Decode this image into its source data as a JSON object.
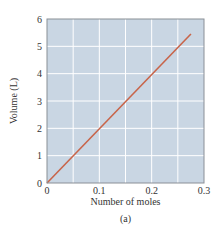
{
  "chart_data": {
    "type": "line",
    "title": "",
    "xlabel": "Number of moles",
    "ylabel": "Volume (L)",
    "caption": "(a)",
    "xlim": [
      0,
      0.3
    ],
    "ylim": [
      0,
      6
    ],
    "xticks": [
      0,
      0.1,
      0.2,
      0.3
    ],
    "xtick_labels": [
      "0",
      "0.1",
      "0.2",
      "0.3"
    ],
    "yticks": [
      0,
      1,
      2,
      3,
      4,
      5,
      6
    ],
    "ytick_labels": [
      "0",
      "1",
      "2",
      "3",
      "4",
      "5",
      "6"
    ],
    "x_grid_step": 0.05,
    "y_grid_step": 1,
    "grid": true,
    "legend": null,
    "series": [
      {
        "name": "Volume vs moles",
        "x": [
          0,
          0.275
        ],
        "y": [
          0,
          5.45
        ]
      }
    ],
    "colors": {
      "plot_background": "#c9d6e3",
      "grid": "#ffffff",
      "frame": "#8a8f96",
      "line": "#c8654a"
    }
  }
}
